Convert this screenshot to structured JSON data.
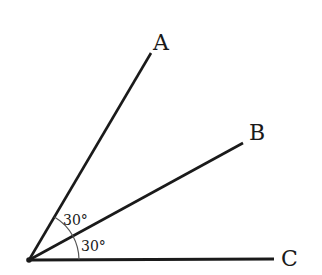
{
  "diagram": {
    "vertex": {
      "x": 29,
      "y": 260
    },
    "rays": [
      {
        "name": "A",
        "end": {
          "x": 151,
          "y": 53
        },
        "label_pos": {
          "x": 153,
          "y": 50
        }
      },
      {
        "name": "B",
        "end": {
          "x": 243,
          "y": 143
        },
        "label_pos": {
          "x": 249,
          "y": 140
        }
      },
      {
        "name": "C",
        "end": {
          "x": 274,
          "y": 259
        },
        "label_pos": {
          "x": 281,
          "y": 266
        }
      }
    ],
    "angles": [
      {
        "between": [
          "A",
          "B"
        ],
        "label": "30°"
      },
      {
        "between": [
          "B",
          "C"
        ],
        "label": "30°"
      }
    ],
    "colors": {
      "line": "#1a1a1a",
      "arc": "#555555",
      "background": "#ffffff"
    }
  }
}
